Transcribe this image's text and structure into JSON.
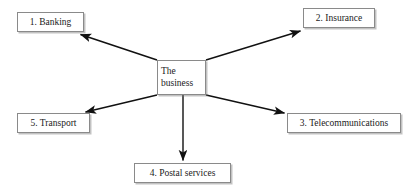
{
  "diagram": {
    "type": "radial-spider-diagram",
    "title_text": "",
    "center": {
      "id": "center",
      "label": "The business",
      "label_lines": [
        "The",
        "business"
      ],
      "x": 157,
      "y": 60,
      "w": 49,
      "h": 35
    },
    "nodes": [
      {
        "id": "banking",
        "label": "1. Banking",
        "number": 1,
        "name": "Banking",
        "x": 17,
        "y": 12,
        "w": 67,
        "h": 20,
        "position": "top-left"
      },
      {
        "id": "insurance",
        "label": "2. Insurance",
        "number": 2,
        "name": "Insurance",
        "x": 303,
        "y": 8,
        "w": 72,
        "h": 20,
        "position": "top-right"
      },
      {
        "id": "telecom",
        "label": "3. Telecommunications",
        "number": 3,
        "name": "Telecommunications",
        "x": 287,
        "y": 113,
        "w": 114,
        "h": 20,
        "position": "bottom-right"
      },
      {
        "id": "postal",
        "label": "4. Postal services",
        "number": 4,
        "name": "Postal services",
        "x": 134,
        "y": 163,
        "w": 97,
        "h": 20,
        "position": "bottom-center"
      },
      {
        "id": "transport",
        "label": "5. Transport",
        "number": 5,
        "name": "Transport",
        "x": 17,
        "y": 113,
        "w": 73,
        "h": 20,
        "position": "bottom-left"
      }
    ],
    "edges": [
      {
        "id": "edge-center-banking",
        "from": "center",
        "to": "banking",
        "arrow": "to-target",
        "x1": 157,
        "y1": 60,
        "x2": 79,
        "y2": 34
      },
      {
        "id": "edge-center-insurance",
        "from": "center",
        "to": "insurance",
        "arrow": "to-target",
        "x1": 206,
        "y1": 60,
        "x2": 301,
        "y2": 31
      },
      {
        "id": "edge-center-telecom",
        "from": "center",
        "to": "telecom",
        "arrow": "to-target",
        "x1": 206,
        "y1": 95,
        "x2": 285,
        "y2": 113
      },
      {
        "id": "edge-center-postal",
        "from": "center",
        "to": "postal",
        "arrow": "to-target",
        "x1": 183,
        "y1": 95,
        "x2": 183,
        "y2": 161
      },
      {
        "id": "edge-center-transport",
        "from": "center",
        "to": "transport",
        "arrow": "to-target",
        "x1": 157,
        "y1": 95,
        "x2": 84,
        "y2": 112
      }
    ],
    "colors": {
      "background": "#ffffff",
      "box_border": "#8a8a8a",
      "box_fill": "#ffffff",
      "box_shadow": "#787878",
      "text": "#1a1a1a",
      "edge_line": "#111111"
    }
  }
}
